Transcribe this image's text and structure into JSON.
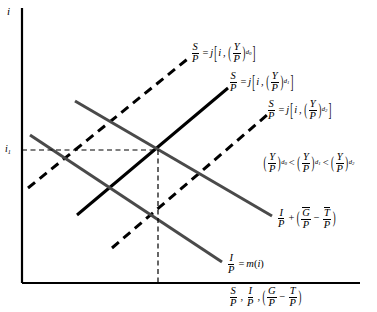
{
  "figure": {
    "type": "economics-loanable-funds-diagram",
    "background": "#ffffff",
    "line_color_solid_gray": "#4a4a4a",
    "line_color_black": "#000000",
    "axis_color": "#000000",
    "width": 377,
    "height": 312
  },
  "axes": {
    "y_label": "i",
    "x_label_parts": {
      "s_over_p_num": "S",
      "s_over_p_den": "P",
      "comma1": ",",
      "i_over_p_num": "I",
      "i_over_p_den": "P",
      "comma2": ",",
      "g_over_p_num": "G",
      "g_over_p_den": "P",
      "minus": "−",
      "t_over_p_num": "T",
      "t_over_p_den": "P"
    },
    "tick_y": {
      "label_base": "i",
      "label_sub": "1"
    }
  },
  "curves": {
    "saving_d0": {
      "name": "S/P = j[i, (Y/P)_d0]",
      "style": "dashed",
      "lhs_num": "S",
      "lhs_den": "P",
      "equals": "=",
      "fn": "j",
      "bracket_open": "[",
      "arg1": "i",
      "comma": ",",
      "arg2_num": "Y",
      "arg2_den": "P",
      "arg2_sub": "d",
      "arg2_sub2": "0",
      "bracket_close": "]"
    },
    "saving_d1": {
      "name": "S/P = j[i, (Y/P)_d1]",
      "style": "solid",
      "lhs_num": "S",
      "lhs_den": "P",
      "equals": "=",
      "fn": "j",
      "bracket_open": "[",
      "arg1": "i",
      "comma": ",",
      "arg2_num": "Y",
      "arg2_den": "P",
      "arg2_sub": "d",
      "arg2_sub2": "1",
      "bracket_close": "]"
    },
    "saving_d2": {
      "name": "S/P = j[i, (Y/P)_d2]",
      "style": "dashed",
      "lhs_num": "S",
      "lhs_den": "P",
      "equals": "=",
      "fn": "j",
      "bracket_open": "[",
      "arg1": "i",
      "comma": ",",
      "arg2_num": "Y",
      "arg2_den": "P",
      "arg2_sub": "d",
      "arg2_sub2": "2",
      "bracket_close": "]"
    },
    "investment_plus_deficit": {
      "name": "I/P + (G-bar/P - T-bar/P)",
      "style": "solid-gray",
      "i_num": "I",
      "i_den": "P",
      "plus": "+",
      "paren_open": "(",
      "g_num": "G",
      "g_den": "P",
      "minus": "−",
      "t_num": "T",
      "t_den": "P",
      "paren_close": ")"
    },
    "investment": {
      "name": "I/P = m(i)",
      "style": "solid-gray",
      "i_num": "I",
      "i_den": "P",
      "equals": "=",
      "fn": "m",
      "paren_open": "(",
      "arg": "i",
      "paren_close": ")"
    }
  },
  "annotation": {
    "inequality": {
      "a_num": "Y",
      "a_den": "P",
      "a_sub": "d",
      "a_sub2": "0",
      "lt1": "<",
      "b_num": "Y",
      "b_den": "P",
      "b_sub": "d",
      "b_sub2": "1",
      "lt2": "<",
      "c_num": "Y",
      "c_den": "P",
      "c_sub": "d",
      "c_sub2": "2"
    }
  },
  "geometry": {
    "origin": {
      "x": 22,
      "y": 283
    },
    "y_axis_top": {
      "x": 22,
      "y": 8
    },
    "x_axis_right": {
      "x": 360,
      "y": 283
    },
    "equilibrium": {
      "x": 158,
      "y": 150
    },
    "saving_d0_line": {
      "x1": 28,
      "y1": 188,
      "x2": 190,
      "y2": 57
    },
    "saving_d1_line": {
      "x1": 77,
      "y1": 215,
      "x2": 228,
      "y2": 88
    },
    "saving_d2_line": {
      "x1": 112,
      "y1": 248,
      "x2": 267,
      "y2": 115
    },
    "invest_deficit_line": {
      "x1": 75,
      "y1": 101,
      "x2": 272,
      "y2": 216
    },
    "invest_line": {
      "x1": 30,
      "y1": 135,
      "x2": 222,
      "y2": 262
    },
    "dashed_guide_h": {
      "x1": 22,
      "y1": 150,
      "x2": 158,
      "y2": 150
    },
    "dashed_guide_v": {
      "x1": 158,
      "y1": 150,
      "x2": 158,
      "y2": 283
    }
  }
}
